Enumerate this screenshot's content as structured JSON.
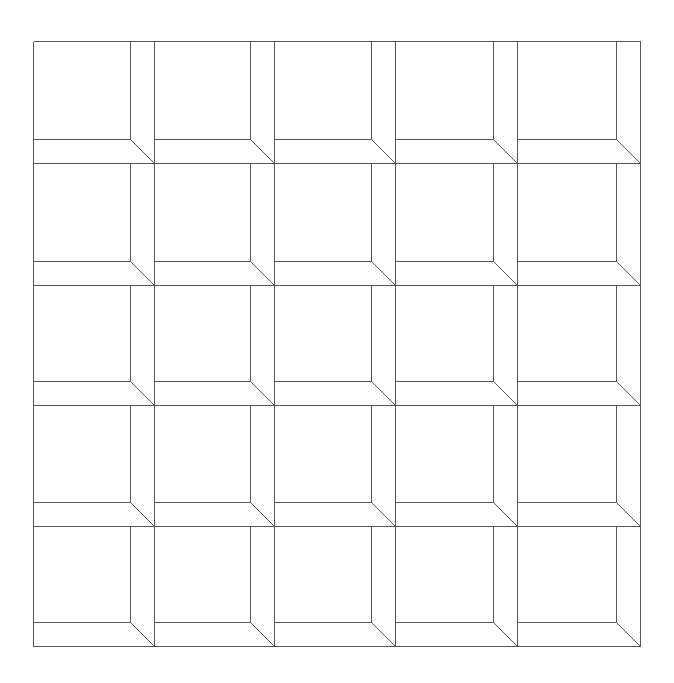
{
  "diagram": {
    "type": "grid-of-beveled-squares",
    "rows": 5,
    "cols": 5,
    "line_color": "#555555",
    "background_color": "#ffffff",
    "stroke_width": 1,
    "origin": {
      "x": 33,
      "y": 41
    },
    "col_edges": [
      33,
      154,
      274,
      395,
      517,
      640
    ],
    "row_edges": [
      41,
      163,
      285,
      405,
      526,
      646
    ],
    "bevel_width": 24,
    "cell_description": "Each cell contains an inner square frame with a bevel band on the right and bottom sides; a diagonal line joins the inner bottom-right corner to the outer bottom-right corner."
  }
}
